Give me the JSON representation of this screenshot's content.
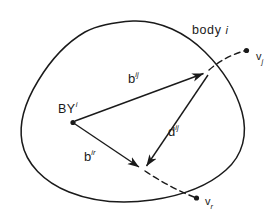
{
  "figure": {
    "domain": "diagram",
    "kind": "vector-kinematics-diagram",
    "background_color": "#ffffff",
    "stroke_color": "#1a1a1a",
    "labels": {
      "body": {
        "text": "body",
        "symbol": "i"
      },
      "origin": {
        "text": "BY",
        "sup": "i"
      },
      "vector_bij": {
        "text": "b",
        "sup": "ij"
      },
      "vector_bir": {
        "text": "b",
        "sup": "ir"
      },
      "vector_dij": {
        "text": "d",
        "sup": "ij"
      },
      "node_vj": {
        "text": "v",
        "sub": "j"
      },
      "node_vr": {
        "text": "v",
        "sub": "r"
      }
    },
    "geometry": {
      "origin_point": [
        73,
        122
      ],
      "joint_j_point": [
        208,
        71
      ],
      "joint_r_point": [
        143,
        170
      ],
      "node_vj_point": [
        248,
        50
      ],
      "node_vr_point": [
        198,
        200
      ]
    }
  }
}
